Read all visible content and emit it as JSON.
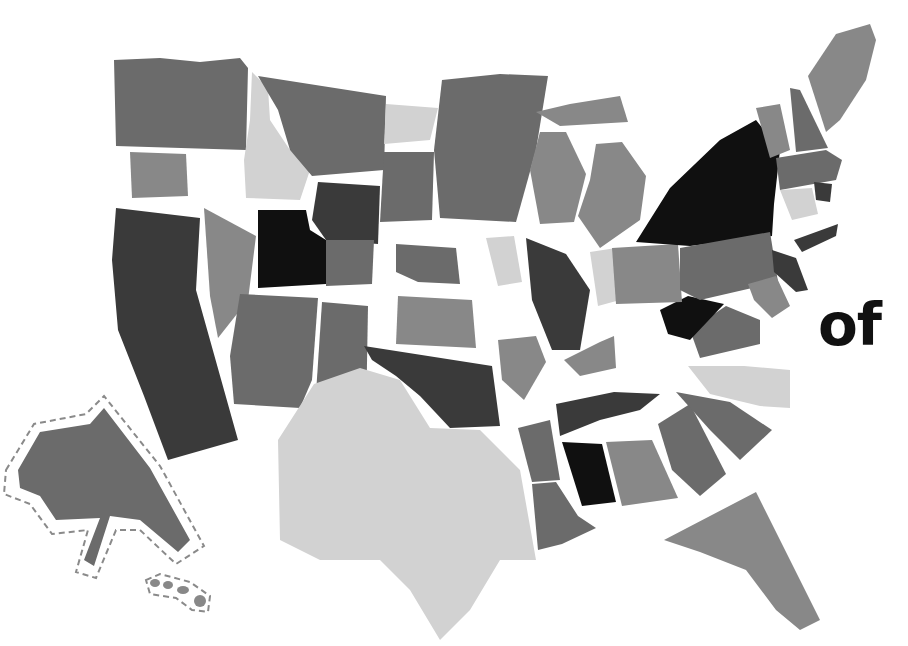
{
  "caption": {
    "text": "of"
  },
  "palette": {
    "black": "#101010",
    "dark": "#3a3a3a",
    "medium": "#6b6b6b",
    "mid": "#888888",
    "light": "#d2d2d2",
    "dash": "#8a8a8a"
  },
  "states": [
    {
      "name": "washington",
      "tone": "medium",
      "points": "114,60 160,58 200,62 240,58 248,68 246,150 116,146"
    },
    {
      "name": "oregon",
      "tone": "mid",
      "points": "130,152 186,154 188,196 132,198"
    },
    {
      "name": "california",
      "tone": "dark",
      "points": "116,208 200,218 196,290 238,440 168,460 144,396 118,330 112,260"
    },
    {
      "name": "nevada",
      "tone": "mid",
      "points": "204,208 256,236 248,300 218,338 210,296"
    },
    {
      "name": "idaho",
      "tone": "light",
      "points": "252,72 268,88 270,120 290,150 310,170 300,200 246,198 244,160 250,120"
    },
    {
      "name": "montana",
      "tone": "medium",
      "points": "258,76 386,96 384,170 312,176 290,150 278,110"
    },
    {
      "name": "wyoming",
      "tone": "dark",
      "points": "318,182 380,186 378,244 326,240 312,220"
    },
    {
      "name": "utah",
      "tone": "black",
      "points": "258,210 306,210 310,230 326,240 326,284 258,288"
    },
    {
      "name": "colorado",
      "tone": "medium",
      "points": "326,240 374,240 372,284 326,286"
    },
    {
      "name": "arizona",
      "tone": "medium",
      "points": "240,294 318,298 312,380 300,408 234,404 230,356"
    },
    {
      "name": "new-mexico",
      "tone": "medium",
      "points": "322,302 368,306 366,420 314,424"
    },
    {
      "name": "north-dakota",
      "tone": "light",
      "points": "386,104 438,108 430,140 384,144"
    },
    {
      "name": "south-dakota",
      "tone": "medium",
      "points": "384,152 434,152 432,220 380,222"
    },
    {
      "name": "minnesota",
      "tone": "medium",
      "points": "442,80 500,74 548,76 536,150 516,222 440,218 434,150"
    },
    {
      "name": "nebraska",
      "tone": "medium",
      "points": "396,244 456,248 460,284 418,282 396,272"
    },
    {
      "name": "kansas",
      "tone": "mid",
      "points": "398,296 472,300 476,348 396,344"
    },
    {
      "name": "iowa",
      "tone": "light",
      "points": "486,238 514,236 522,282 498,286"
    },
    {
      "name": "oklahoma",
      "tone": "dark",
      "points": "364,346 492,366 500,426 450,428 420,396 396,376 372,360"
    },
    {
      "name": "texas",
      "tone": "light",
      "points": "314,384 360,368 400,380 430,428 480,430 520,470 536,560 500,560 470,610 440,640 410,590 380,560 320,560 280,540 278,440"
    },
    {
      "name": "missouri",
      "tone": "dark",
      "points": "526,238 566,254 590,290 580,350 552,350 532,300"
    },
    {
      "name": "arkansas",
      "tone": "mid",
      "points": "498,340 536,336 546,362 524,400 502,380"
    },
    {
      "name": "louisiana",
      "tone": "medium",
      "points": "532,484 556,482 578,516 596,528 562,544 538,550"
    },
    {
      "name": "mississippi",
      "tone": "medium",
      "points": "518,428 550,420 560,480 532,482"
    },
    {
      "name": "alabama",
      "tone": "black",
      "points": "562,442 602,444 616,502 582,506"
    },
    {
      "name": "georgia",
      "tone": "mid",
      "points": "606,442 652,440 678,498 622,506"
    },
    {
      "name": "florida",
      "tone": "mid",
      "points": "664,540 756,492 820,620 800,630 776,610 746,570 700,552"
    },
    {
      "name": "tennessee",
      "tone": "dark",
      "points": "556,404 614,392 660,394 640,410 600,420 560,436"
    },
    {
      "name": "kentucky",
      "tone": "mid",
      "points": "564,360 600,342 614,336 616,368 580,376"
    },
    {
      "name": "south-carolina",
      "tone": "medium",
      "points": "658,424 690,404 726,474 700,496 672,470"
    },
    {
      "name": "north-carolina",
      "tone": "medium",
      "points": "676,392 730,402 772,430 740,460 710,430"
    },
    {
      "name": "virginia",
      "tone": "light",
      "points": "688,366 744,366 790,370 790,408 760,406 710,394"
    },
    {
      "name": "west-virginia",
      "tone": "medium",
      "points": "690,330 726,306 760,320 760,344 700,358"
    },
    {
      "name": "ohio",
      "tone": "black",
      "points": "660,310 688,296 724,304 690,340 668,334"
    },
    {
      "name": "indiana",
      "tone": "light",
      "points": "590,252 616,248 620,300 598,306"
    },
    {
      "name": "illinois",
      "tone": "mid",
      "points": "612,248 678,244 682,302 616,304"
    },
    {
      "name": "wisconsin",
      "tone": "mid",
      "points": "540,132 566,132 586,174 574,222 540,224 530,170"
    },
    {
      "name": "michigan",
      "tone": "mid",
      "points": "596,144 622,142 646,176 640,220 600,248 578,216 590,180"
    },
    {
      "name": "upper-michigan",
      "tone": "mid",
      "points": "536,112 570,104 620,96 628,122 560,126"
    },
    {
      "name": "pennsylvania",
      "tone": "black",
      "points": "636,242 670,188 720,140 756,120 780,150 774,204 772,236 690,246"
    },
    {
      "name": "new-york",
      "tone": "medium",
      "points": "680,248 770,232 778,282 700,300 680,290"
    },
    {
      "name": "new-jersey",
      "tone": "dark",
      "points": "772,250 796,258 808,290 796,292 774,272"
    },
    {
      "name": "maryland",
      "tone": "mid",
      "points": "748,284 776,276 790,306 772,318 754,300"
    },
    {
      "name": "delaware",
      "tone": "dark",
      "points": "794,240 838,224 836,236 802,252"
    },
    {
      "name": "vermont",
      "tone": "mid",
      "points": "756,108 780,104 790,150 770,158"
    },
    {
      "name": "new-hampshire",
      "tone": "medium",
      "points": "790,88 800,90 828,148 796,152"
    },
    {
      "name": "maine",
      "tone": "mid",
      "points": "808,76 836,34 870,24 876,40 866,80 840,120 826,132"
    },
    {
      "name": "massachusetts",
      "tone": "medium",
      "points": "776,158 826,150 842,160 836,180 780,190"
    },
    {
      "name": "connecticut",
      "tone": "light",
      "points": "780,190 812,188 818,214 792,220"
    },
    {
      "name": "rhode-island",
      "tone": "dark",
      "points": "814,182 832,184 830,202 816,200"
    }
  ],
  "alaska": {
    "name": "alaska",
    "tone": "medium",
    "points": "18,470 40,432 90,424 104,408 150,468 190,540 178,552 140,520 110,516 94,566 84,560 100,518 56,520 40,496 20,488",
    "outline": "6,470 34,424 86,414 104,396 160,466 204,546 176,564 140,530 116,530 96,578 76,572 88,530 52,534 30,504 4,494"
  },
  "hawaii": {
    "islands": [
      {
        "cx": 155,
        "cy": 583,
        "rx": 5,
        "ry": 4
      },
      {
        "cx": 168,
        "cy": 585,
        "rx": 5,
        "ry": 4
      },
      {
        "cx": 183,
        "cy": 590,
        "rx": 6,
        "ry": 4
      },
      {
        "cx": 200,
        "cy": 601,
        "rx": 6,
        "ry": 6
      }
    ],
    "outline": "146,580 160,574 190,582 210,596 208,612 192,610 176,598 150,594"
  }
}
